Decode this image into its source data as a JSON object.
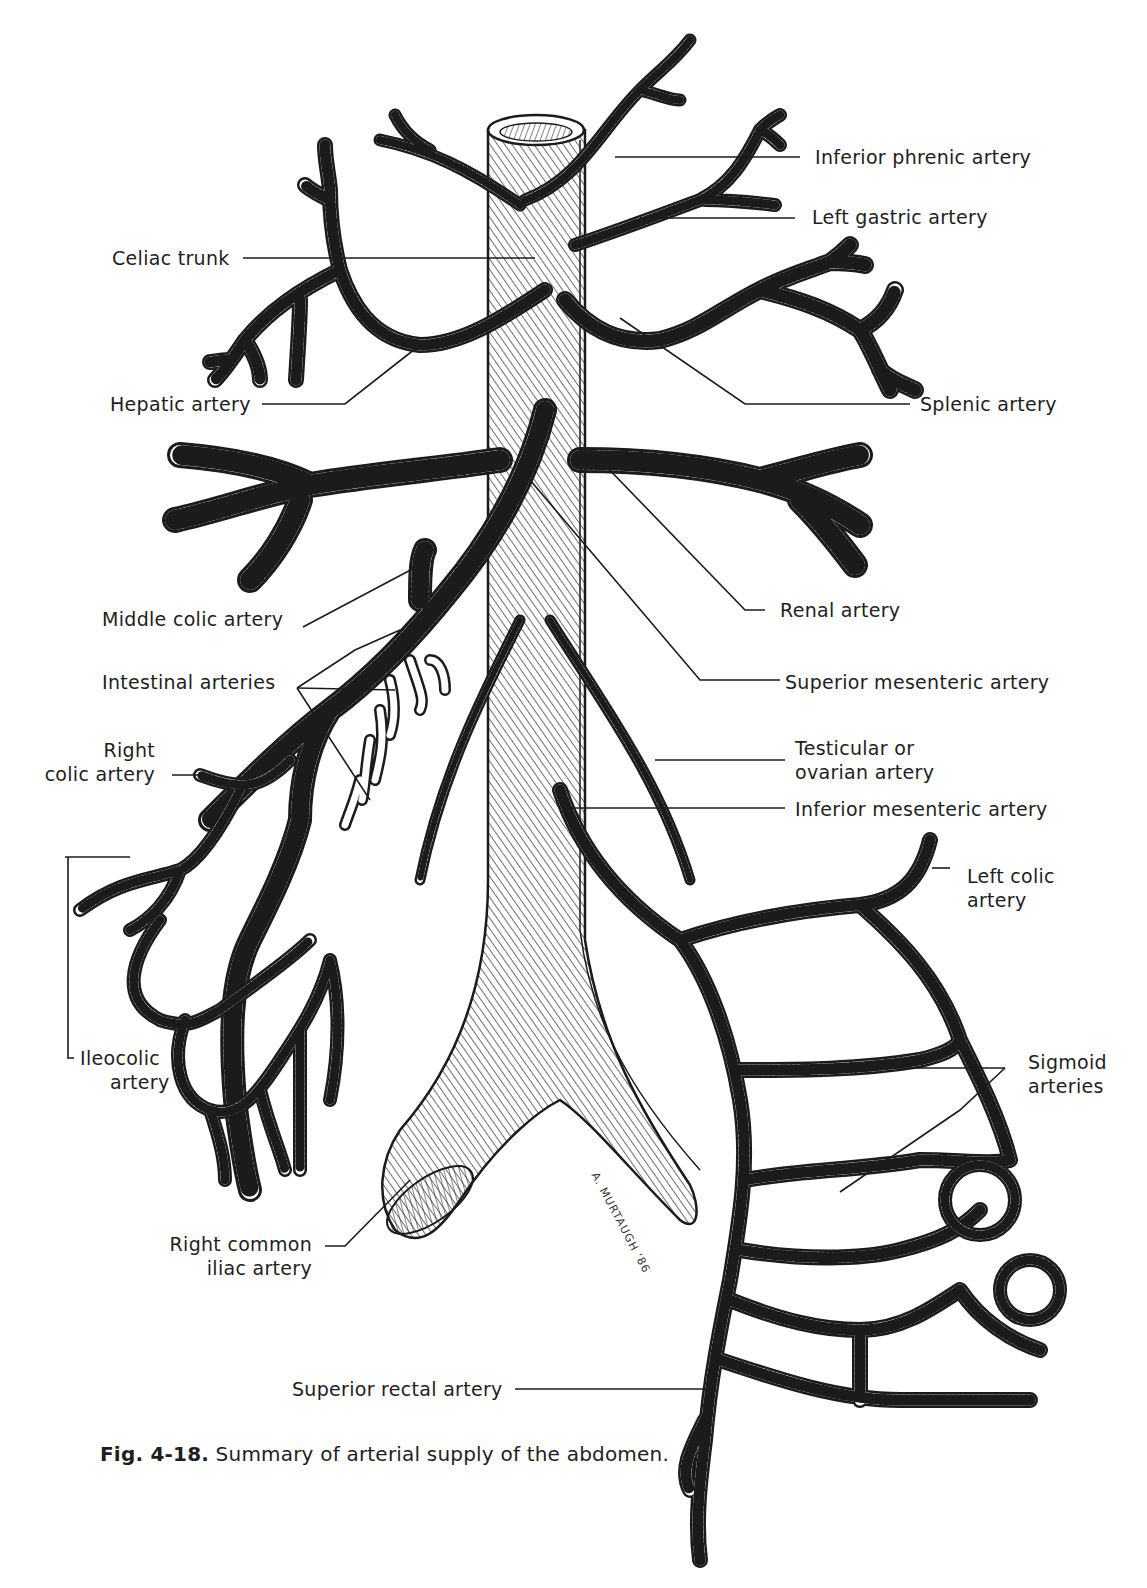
{
  "figure": {
    "number": "Fig. 4-18.",
    "caption": "Summary of arterial supply of the abdomen.",
    "signature": "A. MURTAUGH '86"
  },
  "labels": {
    "inferior_phrenic": "Inferior phrenic artery",
    "left_gastric": "Left gastric artery",
    "celiac_trunk": "Celiac trunk",
    "hepatic": "Hepatic artery",
    "splenic": "Splenic artery",
    "renal": "Renal artery",
    "middle_colic": "Middle colic artery",
    "superior_mesenteric": "Superior mesenteric artery",
    "intestinal": "Intestinal arteries",
    "right_colic_l1": "Right",
    "right_colic_l2": "colic artery",
    "testicular_l1": "Testicular or",
    "testicular_l2": "ovarian artery",
    "inferior_mesenteric": "Inferior mesenteric artery",
    "left_colic_l1": "Left colic",
    "left_colic_l2": "artery",
    "ileocolic_l1": "Ileocolic",
    "ileocolic_l2": "artery",
    "sigmoid_l1": "Sigmoid",
    "sigmoid_l2": "arteries",
    "right_common_iliac_l1": "Right common",
    "right_common_iliac_l2": "iliac artery",
    "superior_rectal": "Superior rectal artery"
  },
  "colors": {
    "ink": "#1b1b1b",
    "paper": "#ffffff"
  }
}
